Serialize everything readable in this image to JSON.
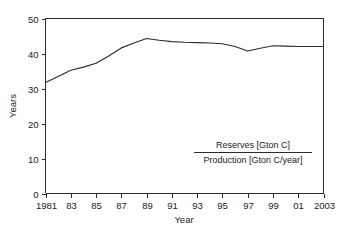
{
  "chart_data": {
    "type": "line",
    "title": "",
    "subtitle": "",
    "xlabel": "Year",
    "ylabel": "Years",
    "xlim": [
      1981,
      2003
    ],
    "ylim": [
      0,
      50
    ],
    "grid": false,
    "legend_position": "none",
    "x_tick_labels": [
      "1981",
      "83",
      "85",
      "87",
      "89",
      "91",
      "93",
      "95",
      "97",
      "99",
      "01",
      "2003"
    ],
    "x_tick_values": [
      1981,
      1983,
      1985,
      1987,
      1989,
      1991,
      1993,
      1995,
      1997,
      1999,
      2001,
      2003
    ],
    "y_tick_labels": [
      "0",
      "10",
      "20",
      "30",
      "40",
      "50"
    ],
    "y_tick_values": [
      0,
      10,
      20,
      30,
      40,
      50
    ],
    "x": [
      1981,
      1982,
      1983,
      1984,
      1985,
      1986,
      1987,
      1988,
      1989,
      1990,
      1991,
      1992,
      1993,
      1994,
      1995,
      1996,
      1997,
      1998,
      1999,
      2000,
      2001,
      2002,
      2003
    ],
    "values": [
      31.7,
      33.4,
      35.2,
      36.1,
      37.2,
      39.3,
      41.6,
      43.0,
      44.3,
      43.8,
      43.4,
      43.2,
      43.1,
      43.0,
      42.8,
      42.0,
      40.7,
      41.5,
      42.2,
      42.1,
      42.0,
      42.0,
      42.0
    ],
    "series": [
      {
        "name": "Reserves / Production",
        "color": "#2b2b2b",
        "values": [
          31.7,
          33.4,
          35.2,
          36.1,
          37.2,
          39.3,
          41.6,
          43.0,
          44.3,
          43.8,
          43.4,
          43.2,
          43.1,
          43.0,
          42.8,
          42.0,
          40.7,
          41.5,
          42.2,
          42.1,
          42.0,
          42.0,
          42.0
        ]
      }
    ],
    "annotations": {
      "fraction_numerator": "Reserves [Gton C]",
      "fraction_denominator": "Production [Gton C/year]"
    }
  },
  "colors": {
    "line": "#2b2b2b",
    "axis": "#2b2b2b",
    "text": "#222222",
    "background": "#ffffff"
  }
}
